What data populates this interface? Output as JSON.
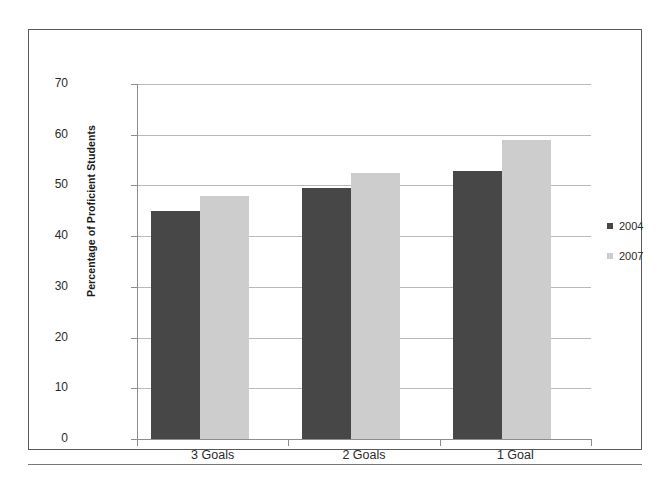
{
  "chart_data": {
    "type": "bar",
    "title": "",
    "xlabel": "",
    "ylabel": "Percentage of Proficient Students",
    "categories": [
      "3 Goals",
      "2 Goals",
      "1 Goal"
    ],
    "series": [
      {
        "name": "2004",
        "color": "#474747",
        "values": [
          45,
          49.5,
          52.8
        ]
      },
      {
        "name": "2007",
        "color": "#cdcdcd",
        "values": [
          48,
          52.5,
          59
        ]
      }
    ],
    "ylim": [
      0,
      70
    ],
    "ytick_labels": [
      "70",
      "60",
      "50",
      "40",
      "30",
      "20",
      "10",
      "0"
    ],
    "ytick_values": [
      70,
      60,
      50,
      40,
      30,
      20,
      10,
      0
    ],
    "grid": true,
    "legend_position": "right"
  },
  "legend": {
    "entries": [
      {
        "label": "2004",
        "color": "#474747"
      },
      {
        "label": "2007",
        "color": "#cdcdcd"
      }
    ]
  }
}
